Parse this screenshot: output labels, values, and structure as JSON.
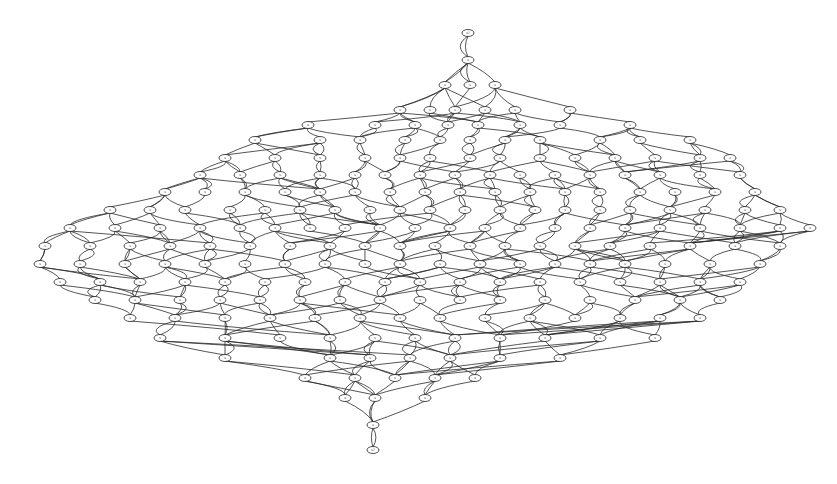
{
  "diagram": {
    "type": "directed-graph",
    "layout": "layered-top-to-bottom",
    "node_shape": "ellipse",
    "colors": {
      "background": "#ffffff",
      "stroke": "#222222"
    },
    "root": {
      "label": "s?",
      "x": 468,
      "y": 33
    },
    "sink": {
      "label": "s?",
      "x": 373,
      "y": 450
    },
    "rows": [
      {
        "y": 60,
        "xs": [
          468
        ]
      },
      {
        "y": 85,
        "xs": [
          445,
          470,
          495
        ]
      },
      {
        "y": 110,
        "xs": [
          400,
          430,
          455,
          485,
          515,
          570
        ]
      },
      {
        "y": 125,
        "xs": [
          308,
          375,
          415,
          448,
          478,
          520,
          560,
          630
        ]
      },
      {
        "y": 140,
        "xs": [
          255,
          320,
          360,
          405,
          440,
          470,
          505,
          540,
          600,
          640,
          690
        ]
      },
      {
        "y": 158,
        "xs": [
          225,
          275,
          320,
          365,
          400,
          430,
          470,
          500,
          540,
          575,
          615,
          655,
          700,
          730
        ]
      },
      {
        "y": 175,
        "xs": [
          200,
          240,
          280,
          320,
          355,
          385,
          420,
          455,
          490,
          520,
          555,
          590,
          625,
          660,
          700,
          740
        ]
      },
      {
        "y": 192,
        "xs": [
          165,
          205,
          245,
          285,
          320,
          355,
          390,
          425,
          460,
          495,
          530,
          565,
          600,
          640,
          675,
          715,
          755
        ]
      },
      {
        "y": 210,
        "xs": [
          110,
          150,
          185,
          230,
          265,
          300,
          335,
          370,
          400,
          430,
          465,
          500,
          535,
          565,
          600,
          630,
          670,
          705,
          745,
          780
        ]
      },
      {
        "y": 228,
        "xs": [
          70,
          115,
          160,
          200,
          240,
          275,
          310,
          345,
          380,
          415,
          450,
          485,
          520,
          555,
          590,
          625,
          660,
          700,
          740,
          780,
          810
        ]
      },
      {
        "y": 246,
        "xs": [
          45,
          90,
          130,
          170,
          210,
          250,
          290,
          330,
          365,
          400,
          435,
          470,
          505,
          540,
          575,
          610,
          650,
          690,
          735,
          780
        ]
      },
      {
        "y": 264,
        "xs": [
          40,
          80,
          125,
          165,
          205,
          245,
          285,
          325,
          365,
          400,
          440,
          480,
          520,
          555,
          590,
          625,
          665,
          710,
          760
        ]
      },
      {
        "y": 282,
        "xs": [
          60,
          100,
          140,
          185,
          225,
          265,
          305,
          345,
          385,
          420,
          460,
          500,
          540,
          580,
          620,
          660,
          700,
          740
        ]
      },
      {
        "y": 300,
        "xs": [
          95,
          135,
          180,
          220,
          260,
          300,
          340,
          380,
          420,
          460,
          500,
          545,
          590,
          635,
          680,
          720
        ]
      },
      {
        "y": 318,
        "xs": [
          130,
          175,
          225,
          270,
          315,
          360,
          400,
          440,
          485,
          530,
          575,
          620,
          660,
          700
        ]
      },
      {
        "y": 338,
        "xs": [
          160,
          225,
          280,
          330,
          375,
          415,
          455,
          500,
          545,
          600,
          655
        ]
      },
      {
        "y": 358,
        "xs": [
          225,
          330,
          370,
          410,
          450,
          500,
          560
        ]
      },
      {
        "y": 378,
        "xs": [
          305,
          355,
          395,
          435,
          475
        ]
      },
      {
        "y": 398,
        "xs": [
          345,
          375,
          425
        ]
      },
      {
        "y": 425,
        "xs": [
          373
        ]
      }
    ]
  }
}
